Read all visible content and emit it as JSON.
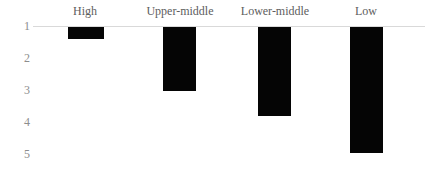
{
  "chart_data": {
    "type": "bar",
    "title": "",
    "subtitle": "",
    "xlabel": "",
    "ylabel": "",
    "categories": [
      "High",
      "Upper-middle",
      "Lower-middle",
      "Low"
    ],
    "values": [
      1.37,
      3.0,
      3.78,
      4.94
    ],
    "series": [
      {
        "name": "",
        "values": [
          1.37,
          3.0,
          3.78,
          4.94
        ]
      }
    ],
    "ylim": [
      1,
      5
    ],
    "y_axis_inverted": true,
    "y_ticks": [
      "1",
      "2",
      "3",
      "4",
      "5"
    ],
    "y_tick_values": [
      1,
      2,
      3,
      4,
      5
    ],
    "baseline": 1,
    "grid": false,
    "legend": false,
    "legend_position": "none",
    "bar_color": "#050505",
    "axis_line_color": "#d9d9d9",
    "tick_label_color": "#8d8d8d",
    "category_label_color": "#5d5d5d",
    "category_label_position": "top"
  }
}
